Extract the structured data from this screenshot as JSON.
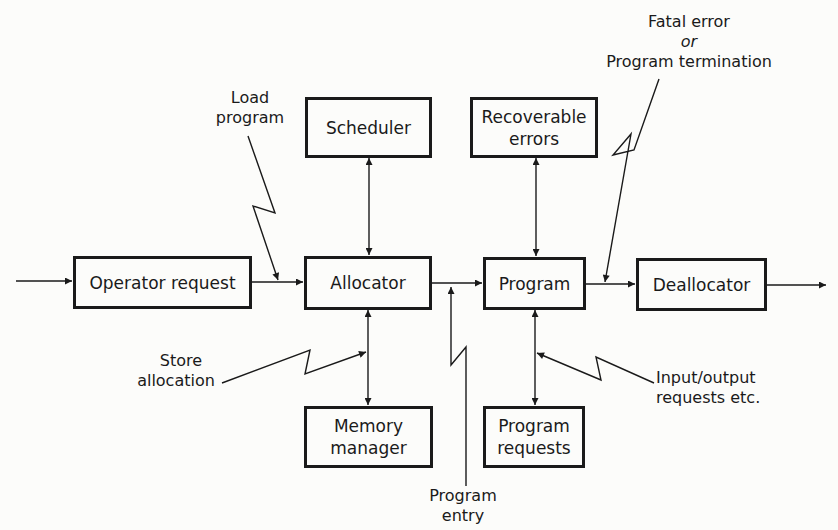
{
  "diagram": {
    "boxes": {
      "operator_request": "Operator request",
      "allocator": "Allocator",
      "program": "Program",
      "deallocator": "Deallocator",
      "scheduler": "Scheduler",
      "recoverable_errors_1": "Recoverable",
      "recoverable_errors_2": "errors",
      "memory_manager_1": "Memory",
      "memory_manager_2": "manager",
      "program_requests_1": "Program",
      "program_requests_2": "requests"
    },
    "labels": {
      "load_program_1": "Load",
      "load_program_2": "program",
      "fatal_error_1": "Fatal error",
      "fatal_error_or": "or",
      "fatal_error_2": "Program termination",
      "store_allocation_1": "Store",
      "store_allocation_2": "allocation",
      "program_entry_1": "Program",
      "program_entry_2": "entry",
      "io_requests_1": "Input/output",
      "io_requests_2": "requests etc."
    },
    "colors": {
      "ink": "#1a1a1a",
      "paper": "#fcfcfa"
    }
  }
}
